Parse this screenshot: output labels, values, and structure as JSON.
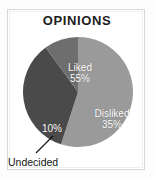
{
  "chart_data": {
    "type": "pie",
    "title": "OPINIONS",
    "categories": [
      "Liked",
      "Disliked",
      "Undecided"
    ],
    "values": [
      55,
      35,
      10
    ],
    "value_labels": [
      "55%",
      "35%",
      "10%"
    ],
    "colors": [
      "#9a9a9a",
      "#4a4a4a",
      "#6e6e6e"
    ],
    "label_colors": [
      "#ffffff",
      "#ffffff",
      "#ffffff"
    ],
    "legend": "none",
    "annotations": [
      {
        "text": "Undecided",
        "target_slice": "Undecided",
        "style": "leader-line"
      }
    ],
    "start_angle_deg": 0,
    "direction": "clockwise",
    "xlabel": "",
    "ylabel": "",
    "grid": false
  },
  "frame": {
    "border_color": "#d8d8d8",
    "background": "#ffffff"
  }
}
